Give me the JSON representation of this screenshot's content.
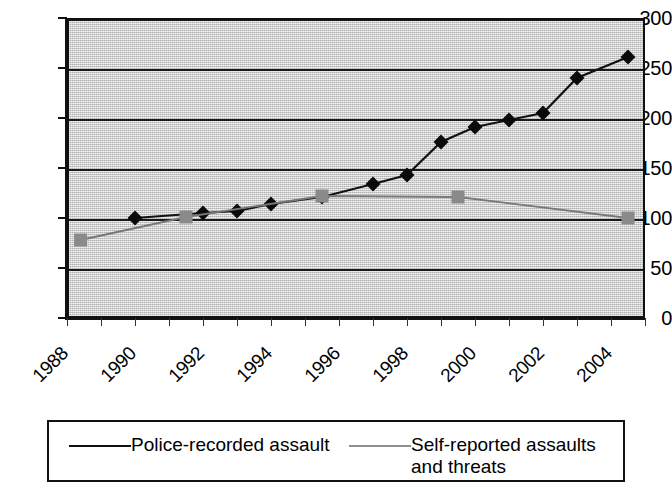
{
  "chart_data": {
    "type": "line",
    "title": "",
    "subtitle": "",
    "xlabel": "",
    "ylabel": "",
    "xlim": [
      1988,
      2005
    ],
    "ylim": [
      0,
      300
    ],
    "grid": true,
    "legend_position": "bottom",
    "y_ticks": [
      0,
      50,
      100,
      150,
      200,
      250,
      300
    ],
    "y_tick_labels": [
      "0",
      "50",
      "100",
      "150",
      "200",
      "250",
      "300"
    ],
    "x_tick_labels": [
      "1988",
      "1990",
      "1992",
      "1994",
      "1996",
      "1998",
      "2000",
      "2002",
      "2004"
    ],
    "x_tick_values": [
      1988,
      1990,
      1992,
      1994,
      1996,
      1998,
      2000,
      2002,
      2004
    ],
    "x_minor_ticks": [
      1988,
      1989,
      1990,
      1991,
      1992,
      1993,
      1994,
      1995,
      1996,
      1997,
      1998,
      1999,
      2000,
      2001,
      2002,
      2003,
      2004,
      2005
    ],
    "series": [
      {
        "name": "Police-recorded assault",
        "marker": "diamond",
        "color": "#0a0a0a",
        "line_color": "#111111",
        "x": [
          1990.0,
          1992.0,
          1993.0,
          1994.0,
          1995.5,
          1997.0,
          1998.0,
          1999.0,
          2000.0,
          2001.0,
          2002.0,
          2003.0,
          2004.5
        ],
        "values": [
          100,
          105,
          107,
          114,
          121,
          134,
          143,
          176,
          191,
          198,
          205,
          240,
          261
        ]
      },
      {
        "name": "Self-reported assaults and threats",
        "marker": "square",
        "color": "#8a8a8a",
        "line_color": "#777777",
        "x": [
          1988.4,
          1991.5,
          1995.5,
          1999.5,
          2004.5
        ],
        "values": [
          78,
          101,
          122,
          121,
          100
        ]
      }
    ]
  },
  "legend": {
    "entries": [
      {
        "label": "Police-recorded assault",
        "marker": "diamond-marker-icon"
      },
      {
        "label": "Self-reported assaults and threats",
        "marker": "square-marker-icon"
      }
    ]
  },
  "colors": {
    "plot_background": "#c8c8c8",
    "axis": "#111111",
    "gridline": "#1a1a1a",
    "series_police": "#0a0a0a",
    "series_self_reported": "#8a8a8a",
    "page_background": "#ffffff"
  }
}
